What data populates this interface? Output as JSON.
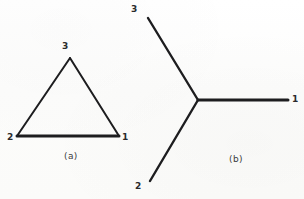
{
  "figure": {
    "background_color": "#fdfdfc",
    "stroke_color": "#1d1d1f",
    "label_color": "#2a2a2c",
    "caption_color": "#3a3a3c",
    "width": 304,
    "height": 199
  },
  "chart_data": {
    "type": "diagram",
    "title": "",
    "subtitle": "",
    "xlabel": "",
    "ylabel": "",
    "grid": false,
    "legend": null,
    "panels": [
      {
        "id": "a",
        "caption": "(a)",
        "caption_pos": [
          72,
          157
        ],
        "shape": "triangle",
        "description": "Closed triangular loop with three labelled vertices",
        "nodes": [
          {
            "label": "1",
            "x": 119,
            "y": 136,
            "label_x": 122,
            "label_y": 135
          },
          {
            "label": "2",
            "x": 17,
            "y": 136,
            "label_x": 7,
            "label_y": 135
          },
          {
            "label": "3",
            "x": 70,
            "y": 58,
            "label_x": 62,
            "label_y": 42
          }
        ],
        "edges": [
          {
            "from": "2",
            "to": "3",
            "width": 2.0
          },
          {
            "from": "3",
            "to": "1",
            "width": 2.0
          },
          {
            "from": "2",
            "to": "1",
            "width": 3.0
          }
        ]
      },
      {
        "id": "b",
        "caption": "(b)",
        "caption_pos": [
          236,
          160
        ],
        "shape": "star-tripod",
        "description": "Three branches meeting at a central junction (Y shape)",
        "junction": {
          "x": 198,
          "y": 100
        },
        "nodes": [
          {
            "label": "1",
            "x": 288,
            "y": 100,
            "label_x": 292,
            "label_y": 96
          },
          {
            "label": "2",
            "x": 150,
            "y": 181,
            "label_x": 135,
            "label_y": 182
          },
          {
            "label": "3",
            "x": 148,
            "y": 18,
            "label_x": 131,
            "label_y": 6
          }
        ],
        "edges": [
          {
            "from": "junction",
            "to": "1",
            "width": 3.0
          },
          {
            "from": "junction",
            "to": "2",
            "width": 2.4
          },
          {
            "from": "junction",
            "to": "3",
            "width": 2.4
          }
        ]
      }
    ]
  }
}
